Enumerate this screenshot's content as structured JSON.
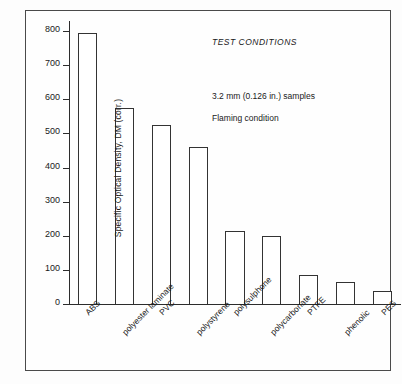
{
  "chart_data": {
    "type": "bar",
    "title": "",
    "xlabel": "",
    "ylabel": "Specific Optical Density, DM (corr.)",
    "ylim": [
      0,
      800
    ],
    "ytick_labels": [
      "0",
      "100",
      "200",
      "300",
      "400",
      "500",
      "600",
      "700",
      "800"
    ],
    "ytick_values": [
      0,
      100,
      200,
      300,
      400,
      500,
      600,
      700,
      800
    ],
    "grid": false,
    "legend": null,
    "categories": [
      "ABS",
      "polyester laminate",
      "PVC",
      "polystyrene",
      "polysulphone",
      "polycarbonate",
      "PTFE",
      "phenolic",
      "PES"
    ],
    "values": [
      795,
      575,
      525,
      460,
      215,
      200,
      85,
      65,
      38
    ],
    "annotations": [
      "TEST CONDITIONS",
      "3.2 mm (0.126 in.) samples",
      "Flaming condition"
    ]
  },
  "annotations": {
    "test_conditions": "TEST CONDITIONS",
    "sample_spec": "3.2 mm (0.126 in.) samples",
    "flame_condition": "Flaming condition"
  },
  "axis": {
    "y_title": "Specific Optical Density, DM (corr.)"
  },
  "colors": {
    "bar_stroke": "#333333",
    "bar_fill": "#ffffff",
    "axis": "#2c2c2c",
    "frame": "#4a4a4a",
    "background": "#fdfdfd",
    "text": "#1a1a1a"
  }
}
